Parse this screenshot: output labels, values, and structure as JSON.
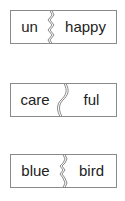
{
  "colors": {
    "border": "#8a8a8a",
    "text": "#222222",
    "background": "#ffffff"
  },
  "cards": [
    {
      "prefix": "un",
      "suffix": "happy",
      "divider": "zigzag"
    },
    {
      "prefix": "care",
      "suffix": "ful",
      "divider": "curve"
    },
    {
      "prefix": "blue",
      "suffix": "bird",
      "divider": "bump"
    }
  ]
}
